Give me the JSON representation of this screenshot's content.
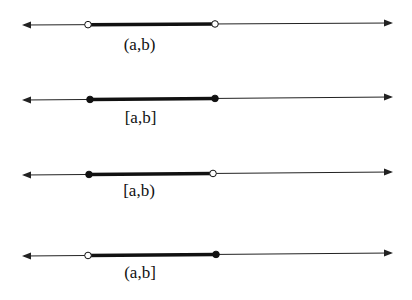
{
  "colors": {
    "line": "#222222",
    "segment": "#111111",
    "background": "#ffffff"
  },
  "lines": [
    {
      "id": "open",
      "label": "(a,b)",
      "left_closed": false,
      "right_closed": false,
      "y_left": 25,
      "y_right": 23,
      "a_x": 88,
      "b_x": 215,
      "label_y": 36
    },
    {
      "id": "closed",
      "label": "[a,b]",
      "left_closed": true,
      "right_closed": true,
      "y_left": 100,
      "y_right": 97,
      "a_x": 90,
      "b_x": 215,
      "label_y": 109
    },
    {
      "id": "half-open-r",
      "label": "[a,b)",
      "left_closed": true,
      "right_closed": false,
      "y_left": 175,
      "y_right": 172,
      "a_x": 89,
      "b_x": 213,
      "label_y": 182
    },
    {
      "id": "half-open-l",
      "label": "(a,b]",
      "left_closed": false,
      "right_closed": true,
      "y_left": 256,
      "y_right": 253,
      "a_x": 88,
      "b_x": 216,
      "label_y": 264
    }
  ],
  "axis": {
    "left_x": 22,
    "right_x": 393
  }
}
